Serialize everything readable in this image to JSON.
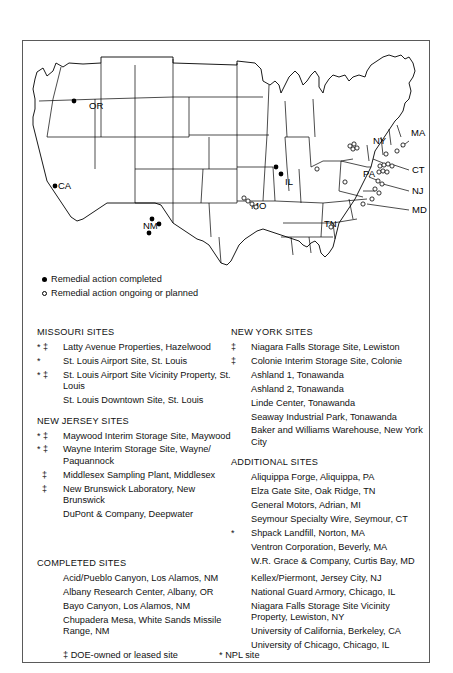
{
  "map": {
    "state_labels": [
      {
        "text": "OR",
        "x": 66,
        "y": 68
      },
      {
        "text": "CA",
        "x": 35,
        "y": 148
      },
      {
        "text": "NM",
        "x": 120,
        "y": 188
      },
      {
        "text": "MO",
        "x": 228,
        "y": 168
      },
      {
        "text": "IL",
        "x": 262,
        "y": 144
      },
      {
        "text": "TN",
        "x": 301,
        "y": 186
      },
      {
        "text": "PA",
        "x": 340,
        "y": 136
      },
      {
        "text": "NY",
        "x": 350,
        "y": 103
      },
      {
        "text": "MA",
        "x": 388,
        "y": 95
      },
      {
        "text": "CT",
        "x": 389,
        "y": 132
      },
      {
        "text": "NJ",
        "x": 389,
        "y": 153
      },
      {
        "text": "MD",
        "x": 389,
        "y": 172
      }
    ],
    "filled_markers": [
      {
        "x": 51,
        "y": 60
      },
      {
        "x": 32,
        "y": 145
      },
      {
        "x": 129,
        "y": 178
      },
      {
        "x": 136,
        "y": 183
      },
      {
        "x": 126,
        "y": 192
      },
      {
        "x": 253,
        "y": 126
      },
      {
        "x": 258,
        "y": 133
      }
    ],
    "open_markers": [
      {
        "x": 221,
        "y": 157
      },
      {
        "x": 225,
        "y": 160
      },
      {
        "x": 229,
        "y": 163
      },
      {
        "x": 233,
        "y": 166
      },
      {
        "x": 294,
        "y": 128
      },
      {
        "x": 322,
        "y": 141
      },
      {
        "x": 308,
        "y": 186
      },
      {
        "x": 327,
        "y": 105
      },
      {
        "x": 331,
        "y": 103
      },
      {
        "x": 330,
        "y": 108
      },
      {
        "x": 334,
        "y": 107
      },
      {
        "x": 363,
        "y": 113
      },
      {
        "x": 374,
        "y": 110
      },
      {
        "x": 380,
        "y": 104
      },
      {
        "x": 357,
        "y": 125
      },
      {
        "x": 361,
        "y": 124
      },
      {
        "x": 365,
        "y": 123
      },
      {
        "x": 369,
        "y": 125
      },
      {
        "x": 356,
        "y": 131
      },
      {
        "x": 360,
        "y": 130
      },
      {
        "x": 364,
        "y": 131
      },
      {
        "x": 355,
        "y": 140
      },
      {
        "x": 359,
        "y": 143
      },
      {
        "x": 352,
        "y": 148
      },
      {
        "x": 356,
        "y": 152
      },
      {
        "x": 349,
        "y": 158
      },
      {
        "x": 340,
        "y": 163
      }
    ]
  },
  "legend": {
    "completed_label": "Remedial action completed",
    "ongoing_label": "Remedial action ongoing or planned",
    "completed_icon": "filled-circle-icon",
    "ongoing_icon": "open-circle-icon"
  },
  "missouri": {
    "title": "MISSOURI SITES",
    "entries": [
      {
        "mark": "* ‡",
        "text": "Latty Avenue Properties, Hazelwood"
      },
      {
        "mark": "*",
        "text": "St. Louis Airport Site, St. Louis"
      },
      {
        "mark": "* ‡",
        "text": "St. Louis Airport Site Vicinity Property, St. Louis"
      },
      {
        "mark": "",
        "text": "St. Louis Downtown Site, St. Louis"
      }
    ]
  },
  "new_jersey": {
    "title": "NEW JERSEY SITES",
    "entries": [
      {
        "mark": "* ‡",
        "text": "Maywood Interim Storage Site, Maywood"
      },
      {
        "mark": "* ‡",
        "text": "Wayne Interim Storage Site, Wayne/ Paquannock"
      },
      {
        "mark": "  ‡",
        "text": "Middlesex Sampling Plant, Middlesex"
      },
      {
        "mark": "  ‡",
        "text": "New Brunswick Laboratory, New Brunswick"
      },
      {
        "mark": "",
        "text": "DuPont & Company, Deepwater"
      }
    ]
  },
  "new_york": {
    "title": "NEW YORK SITES",
    "entries": [
      {
        "mark": "‡",
        "text": "Niagara Falls Storage Site, Lewiston"
      },
      {
        "mark": "‡",
        "text": "Colonie Interim Storage Site, Colonie"
      },
      {
        "mark": "",
        "text": "Ashland 1, Tonawanda"
      },
      {
        "mark": "",
        "text": "Ashland 2, Tonawanda"
      },
      {
        "mark": "",
        "text": "Linde Center, Tonawanda"
      },
      {
        "mark": "",
        "text": "Seaway Industrial Park, Tonawanda"
      },
      {
        "mark": "",
        "text": "Baker and Williams Warehouse, New York City"
      }
    ]
  },
  "additional": {
    "title": "ADDITIONAL SITES",
    "entries": [
      {
        "mark": "",
        "text": "Aliquippa Forge, Aliquippa, PA"
      },
      {
        "mark": "",
        "text": "Elza Gate Site, Oak Ridge, TN"
      },
      {
        "mark": "",
        "text": "General Motors, Adrian, MI"
      },
      {
        "mark": "",
        "text": "Seymour Specialty Wire, Seymour, CT"
      },
      {
        "mark": "*",
        "text": "Shpack Landfill, Norton, MA"
      },
      {
        "mark": "",
        "text": "Ventron Corporation, Beverly, MA"
      },
      {
        "mark": "",
        "text": "W.R. Grace & Company, Curtis Bay, MD"
      }
    ]
  },
  "completed": {
    "title": "COMPLETED SITES",
    "column_one": [
      "Acid/Pueblo Canyon, Los Alamos, NM",
      "Albany Research Center, Albany, OR",
      "Bayo Canyon, Los Alamos, NM",
      "Chupadera Mesa, White Sands Missile Range, NM"
    ],
    "column_two": [
      "Kellex/Piermont, Jersey City, NJ",
      "National Guard Armory, Chicago, IL",
      "Niagara Falls Storage Site Vicinity Property, Lewiston, NY",
      "University of California, Berkeley, CA",
      "University of Chicago, Chicago, IL"
    ]
  },
  "footnotes": {
    "doe": "‡ DOE-owned or leased site",
    "npl": "*  NPL site"
  }
}
